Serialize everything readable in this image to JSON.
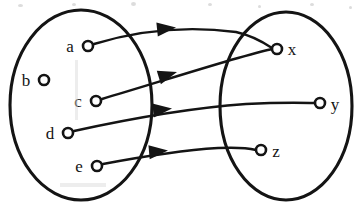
{
  "figure": {
    "kind": "set-mapping-arrow-diagram",
    "background_color": "#ffffff",
    "ink_color": "#141414"
  },
  "sets": [
    {
      "id": "domain",
      "role": "domain",
      "shape": "ellipse",
      "cx": 81,
      "cy": 105,
      "rx": 71,
      "ry": 95,
      "elements": [
        {
          "id": "a",
          "label": "a",
          "cx": 88,
          "cy": 46,
          "r": 5,
          "label_x": 70,
          "label_y": 52
        },
        {
          "id": "b",
          "label": "b",
          "cx": 44,
          "cy": 80,
          "r": 5,
          "label_x": 26,
          "label_y": 86
        },
        {
          "id": "c",
          "label": "c",
          "cx": 96,
          "cy": 101,
          "r": 5,
          "label_x": 78,
          "label_y": 107
        },
        {
          "id": "d",
          "label": "d",
          "cx": 68,
          "cy": 133,
          "r": 5,
          "label_x": 50,
          "label_y": 139
        },
        {
          "id": "e",
          "label": "e",
          "cx": 97,
          "cy": 166,
          "r": 5,
          "label_x": 79,
          "label_y": 172
        }
      ]
    },
    {
      "id": "codomain",
      "role": "codomain",
      "shape": "ellipse",
      "cx": 286,
      "cy": 106,
      "rx": 66,
      "ry": 94,
      "elements": [
        {
          "id": "x",
          "label": "x",
          "cx": 277,
          "cy": 49,
          "r": 5,
          "label_x": 292,
          "label_y": 55
        },
        {
          "id": "y",
          "label": "y",
          "cx": 320,
          "cy": 103,
          "r": 5,
          "label_x": 335,
          "label_y": 110
        },
        {
          "id": "z",
          "label": "z",
          "cx": 261,
          "cy": 150,
          "r": 5,
          "label_x": 276,
          "label_y": 157
        }
      ]
    }
  ],
  "arrows": [
    {
      "id": "a-to-x",
      "from": "a",
      "to": "x",
      "path": "M 94 44 C 140 30 190 26 236 32 C 254 36 266 44 272 48",
      "arrowhead_at": [
        176,
        27.5
      ],
      "arrowhead_angle": -6
    },
    {
      "id": "c-to-x",
      "from": "c",
      "to": "x",
      "path": "M 102 99 C 146 86 196 70 238 58 C 256 53 267 50 272 49",
      "arrowhead_at": [
        177,
        72
      ],
      "arrowhead_angle": -17
    },
    {
      "id": "d-to-y",
      "from": "d",
      "to": "y",
      "path": "M 74 131 C 124 120 190 108 246 104 C 286 102 308 103 315 103",
      "arrowhead_at": [
        172,
        108.5
      ],
      "arrowhead_angle": -6
    },
    {
      "id": "e-to-z",
      "from": "e",
      "to": "z",
      "path": "M 103 164 C 140 157 186 150 218 148 C 240 147 252 149 256 150",
      "arrowhead_at": [
        168,
        150.5
      ],
      "arrowhead_angle": -5
    }
  ],
  "unmapped_elements": [
    "b"
  ],
  "scan_artifacts": {
    "specks": [
      {
        "x": 18,
        "y": 4,
        "w": 5,
        "h": 3
      },
      {
        "x": 72,
        "y": 3,
        "w": 4,
        "h": 3
      },
      {
        "x": 131,
        "y": 2,
        "w": 5,
        "h": 4
      },
      {
        "x": 208,
        "y": 3,
        "w": 4,
        "h": 3
      },
      {
        "x": 258,
        "y": 5,
        "w": 3,
        "h": 3
      },
      {
        "x": 310,
        "y": 3,
        "w": 4,
        "h": 3
      },
      {
        "x": 349,
        "y": 6,
        "w": 3,
        "h": 3
      }
    ],
    "smudges": [
      {
        "x": 75,
        "y": 60,
        "w": 3,
        "h": 60
      },
      {
        "x": 60,
        "y": 183,
        "w": 46,
        "h": 4
      }
    ]
  }
}
